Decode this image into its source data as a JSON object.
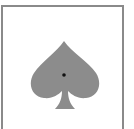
{
  "card": {
    "suit": "spade",
    "icon": "spade-icon",
    "colors": {
      "border": "#8a8a8a",
      "background": "#ffffff",
      "suit_fill": "#8c8c8c",
      "center_dot": "#111111"
    }
  }
}
